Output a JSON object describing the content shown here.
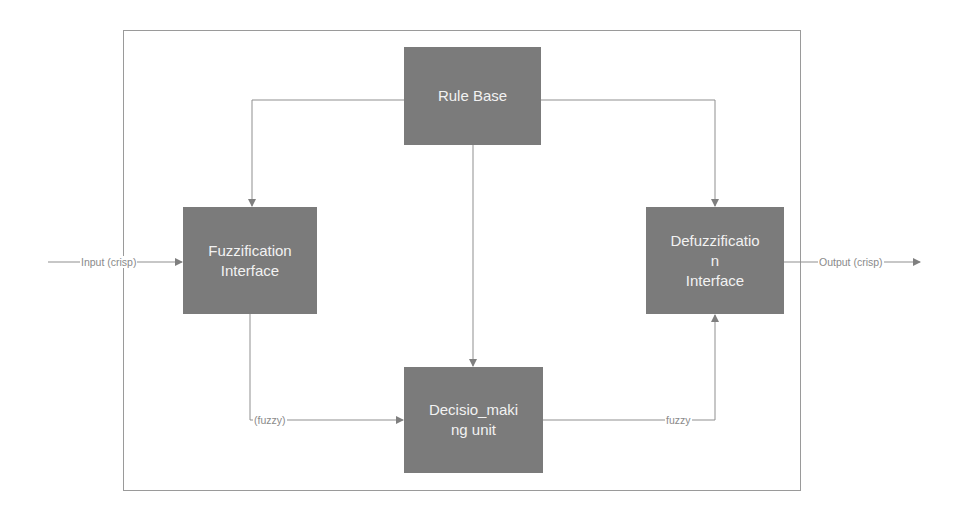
{
  "diagram": {
    "colors": {
      "block_fill": "#7b7b7b",
      "block_text": "#f2f2f2",
      "line": "#8f8f8f",
      "label_text": "#8a8a8a",
      "frame": "#9a9a9a"
    },
    "nodes": {
      "rule_base": {
        "line1": "Rule Base",
        "line2": "",
        "line3": ""
      },
      "fuzzification": {
        "line1": "Fuzzification",
        "line2": "Interface",
        "line3": ""
      },
      "decision": {
        "line1": "Decisio_maki",
        "line2": "ng unit",
        "line3": ""
      },
      "defuzzification": {
        "line1": "Defuzzificatio",
        "line2": "n",
        "line3": "Interface"
      }
    },
    "edges": {
      "input_label": "Input (crisp)",
      "output_label": "Output (crisp)",
      "fuzzy_in_label": "(fuzzy)",
      "fuzzy_out_label": "fuzzy"
    },
    "connections": [
      {
        "from": "input",
        "to": "fuzzification",
        "label": "Input (crisp)"
      },
      {
        "from": "rule_base",
        "to": "fuzzification",
        "label": ""
      },
      {
        "from": "rule_base",
        "to": "decision",
        "label": ""
      },
      {
        "from": "rule_base",
        "to": "defuzzification",
        "label": ""
      },
      {
        "from": "fuzzification",
        "to": "decision",
        "label": "(fuzzy)"
      },
      {
        "from": "decision",
        "to": "defuzzification",
        "label": "fuzzy"
      },
      {
        "from": "defuzzification",
        "to": "output",
        "label": "Output (crisp)"
      }
    ]
  }
}
